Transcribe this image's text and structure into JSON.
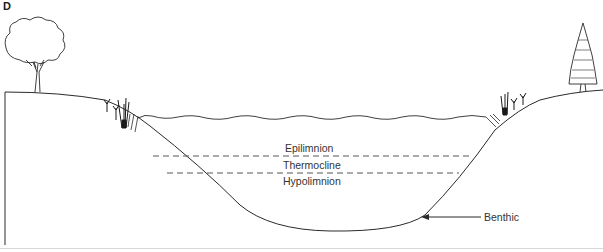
{
  "figure": {
    "panel_letter": "D"
  },
  "labels": {
    "epilimnion": "Epilimnion",
    "thermocline": "Thermocline",
    "hypolimnion": "Hypolimnion",
    "benthic": "Benthic"
  },
  "colors": {
    "line": "#2a2a2a",
    "dash": "#555555",
    "text": "#333333"
  },
  "icons": [
    "deciduous-tree-icon",
    "conifer-tree-icon",
    "reed-plant-icon",
    "arrow-left-icon"
  ]
}
